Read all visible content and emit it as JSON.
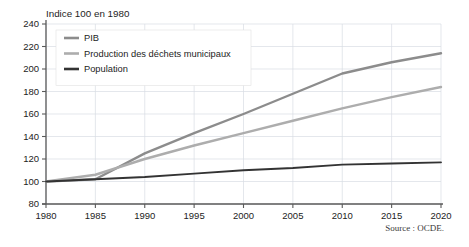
{
  "figure": {
    "axis_title": "Indice 100 en 1980",
    "source": "Source : OCDE."
  },
  "legend": {
    "position": "top-left-inside",
    "entries": [
      {
        "label": "PIB",
        "color": "#8c8c8c"
      },
      {
        "label": "Production des déchets municipaux",
        "color": "#adadad"
      },
      {
        "label": "Population",
        "color": "#333333"
      }
    ]
  },
  "chart_data": {
    "type": "line",
    "title": "Indice 100 en 1980",
    "xlabel": "",
    "ylabel": "",
    "xlim": [
      1980,
      2020
    ],
    "ylim": [
      80,
      240
    ],
    "grid": true,
    "x": [
      1980,
      1985,
      1990,
      1995,
      2000,
      2005,
      2010,
      2015,
      2020
    ],
    "xticks": [
      "1980",
      "1985",
      "1990",
      "1995",
      "2000",
      "2005",
      "2010",
      "2015",
      "2020"
    ],
    "yticks": [
      "80",
      "100",
      "120",
      "140",
      "160",
      "180",
      "200",
      "220",
      "240"
    ],
    "series": [
      {
        "name": "PIB",
        "color": "#8c8c8c",
        "width": 2.4,
        "values": [
          100,
          102,
          125,
          143,
          160,
          178,
          196,
          206,
          214
        ]
      },
      {
        "name": "Production des déchets municipaux",
        "color": "#adadad",
        "width": 2.4,
        "values": [
          100,
          106,
          120,
          132,
          143,
          154,
          165,
          175,
          184
        ]
      },
      {
        "name": "Population",
        "color": "#333333",
        "width": 1.9,
        "values": [
          100,
          102,
          104,
          107,
          110,
          112,
          115,
          116,
          117
        ]
      }
    ]
  }
}
